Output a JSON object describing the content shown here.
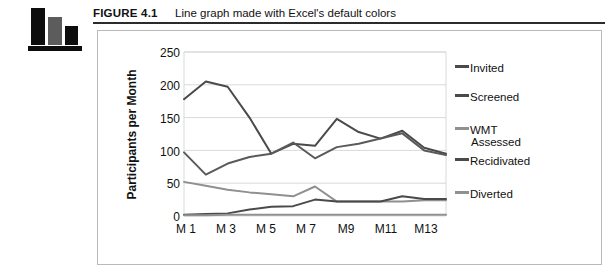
{
  "figure": {
    "label": "FIGURE 4.1",
    "caption": "Line graph made with Excel's default colors",
    "icon": "bar-chart-icon"
  },
  "colors": {
    "dark_line": "#4a4a4a",
    "mid_line": "#5a5a5a",
    "light_line": "#909090",
    "gridline": "#d9d9d9",
    "frame": "#b9b9b9",
    "rule": "#2b2b2b",
    "text": "#111111"
  },
  "chart_data": {
    "type": "line",
    "title": "",
    "xlabel": "",
    "ylabel": "Participants per Month",
    "ylim": [
      0,
      250
    ],
    "yticks": [
      250,
      200,
      150,
      100,
      50,
      0
    ],
    "grid": true,
    "legend_position": "right",
    "x": [
      "M 1",
      "M 2",
      "M 3",
      "M 4",
      "M 5",
      "M 6",
      "M 7",
      "M 8",
      "M 9",
      "M 10",
      "M 11",
      "M 12",
      "M 13"
    ],
    "xtick_labels": [
      "M 1",
      "M 3",
      "M 5",
      "M 7",
      "M9",
      "M11",
      "M13"
    ],
    "series": [
      {
        "name": "Invited",
        "color": "#4a4a4a",
        "values": [
          178,
          205,
          197,
          150,
          95,
          110,
          107,
          148,
          128,
          118,
          130,
          104,
          95
        ]
      },
      {
        "name": "Screened",
        "color": "#5a5a5a",
        "values": [
          97,
          63,
          80,
          90,
          95,
          112,
          88,
          105,
          110,
          118,
          126,
          100,
          93
        ]
      },
      {
        "name": "WMT Assessed",
        "color": "#909090",
        "values": [
          52,
          46,
          40,
          36,
          33,
          30,
          45,
          22,
          22,
          22,
          22,
          24,
          24
        ]
      },
      {
        "name": "Recidivated",
        "color": "#4a4a4a",
        "values": [
          2,
          3,
          4,
          10,
          14,
          15,
          25,
          22,
          22,
          22,
          30,
          26,
          26
        ]
      },
      {
        "name": "Diverted",
        "color": "#909090",
        "values": [
          1,
          1,
          2,
          2,
          2,
          2,
          2,
          2,
          2,
          2,
          2,
          2,
          2
        ]
      }
    ]
  },
  "legend": {
    "items": [
      {
        "label": "Invited",
        "color": "#4a4a4a"
      },
      {
        "label": "Screened",
        "color": "#4a4a4a"
      },
      {
        "label": "WMT",
        "sub": "Assessed",
        "color": "#909090"
      },
      {
        "label": "Recidivated",
        "color": "#4a4a4a"
      },
      {
        "label": "Diverted",
        "color": "#909090"
      }
    ]
  }
}
